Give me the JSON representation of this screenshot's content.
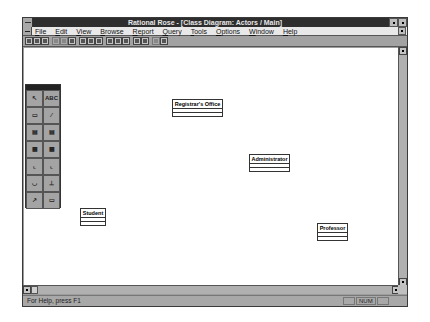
{
  "window": {
    "title": "Rational Rose - [Class Diagram: Actors / Main]",
    "title_bar_color": "#2e2e2e"
  },
  "menu": {
    "items": [
      {
        "label": "File"
      },
      {
        "label": "Edit"
      },
      {
        "label": "View"
      },
      {
        "label": "Browse"
      },
      {
        "label": "Report"
      },
      {
        "label": "Query"
      },
      {
        "label": "Tools"
      },
      {
        "label": "Options"
      },
      {
        "label": "Window"
      },
      {
        "label": "Help"
      }
    ]
  },
  "toolbar": {
    "buttons": [
      {
        "icon": "new-icon",
        "enabled": true
      },
      {
        "icon": "open-icon",
        "enabled": true
      },
      {
        "icon": "save-icon",
        "enabled": true
      },
      {
        "icon": "cut-icon",
        "enabled": false
      },
      {
        "icon": "copy-icon",
        "enabled": false
      },
      {
        "icon": "paste-icon",
        "enabled": true
      },
      {
        "icon": "print-icon",
        "enabled": true
      },
      {
        "icon": "help-icon",
        "enabled": true
      },
      {
        "icon": "context-help-icon",
        "enabled": true
      },
      {
        "icon": "browse-class-diagram-icon",
        "enabled": true
      },
      {
        "icon": "browse-interaction-diagram-icon",
        "enabled": true
      },
      {
        "icon": "browse-component-diagram-icon",
        "enabled": true
      },
      {
        "icon": "browse-parent-icon",
        "enabled": true
      },
      {
        "icon": "browse-previous-icon",
        "enabled": true
      },
      {
        "icon": "zoom-in-icon",
        "enabled": false
      },
      {
        "icon": "zoom-out-icon",
        "enabled": true
      }
    ]
  },
  "palette": {
    "tools": [
      {
        "name": "selection-tool",
        "icon": "arrow-cursor-icon",
        "label": ""
      },
      {
        "name": "text-tool",
        "icon": "text-icon",
        "label": "ABC"
      },
      {
        "name": "note-tool",
        "icon": "note-icon",
        "label": ""
      },
      {
        "name": "anchor-tool",
        "icon": "anchor-line-icon",
        "label": ""
      },
      {
        "name": "class-tool",
        "icon": "class-icon",
        "label": ""
      },
      {
        "name": "parameterized-class-tool",
        "icon": "parameterized-class-icon",
        "label": ""
      },
      {
        "name": "class-utility-tool",
        "icon": "class-utility-icon",
        "label": ""
      },
      {
        "name": "parameterized-utility-tool",
        "icon": "parameterized-utility-icon",
        "label": ""
      },
      {
        "name": "association-tool",
        "icon": "association-icon",
        "label": ""
      },
      {
        "name": "aggregation-tool",
        "icon": "aggregation-icon",
        "label": ""
      },
      {
        "name": "uses-tool",
        "icon": "uses-icon",
        "label": ""
      },
      {
        "name": "instantiation-tool",
        "icon": "instantiation-icon",
        "label": ""
      },
      {
        "name": "inheritance-tool",
        "icon": "inheritance-icon",
        "label": ""
      },
      {
        "name": "class-category-tool",
        "icon": "category-icon",
        "label": ""
      }
    ]
  },
  "diagram": {
    "classes": [
      {
        "name": "Registrar's Office",
        "x": 148,
        "y": 81,
        "w": 51
      },
      {
        "name": "Administrator",
        "x": 225,
        "y": 136,
        "w": 41
      },
      {
        "name": "Student",
        "x": 56,
        "y": 190,
        "w": 26
      },
      {
        "name": "Professor",
        "x": 293,
        "y": 205,
        "w": 31
      }
    ]
  },
  "status": {
    "message": "For Help, press F1",
    "cells": [
      "",
      "NUM",
      ""
    ]
  }
}
